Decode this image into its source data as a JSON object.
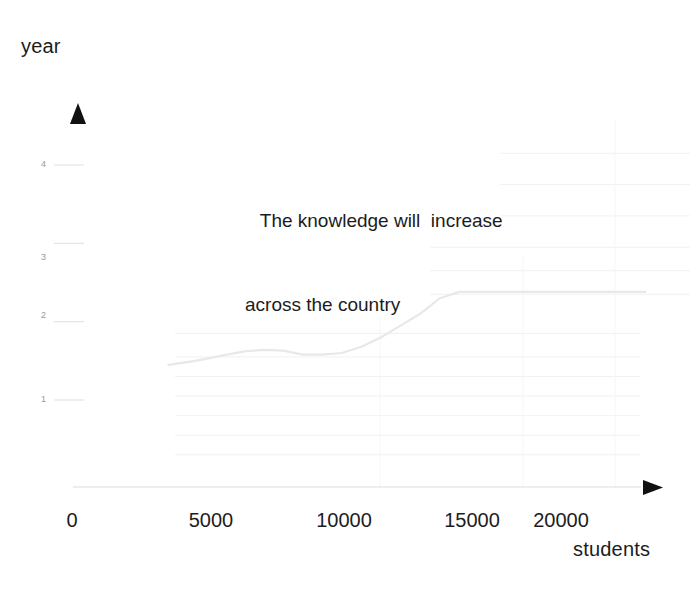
{
  "chart_data": {
    "type": "line",
    "title": "The knowledge will  increase across the country",
    "annotation_lines": [
      "The knowledge will  increase",
      "across the country"
    ],
    "xlabel": "students",
    "ylabel": "year",
    "xlim": [
      0,
      23500
    ],
    "ylim": [
      0,
      4.6
    ],
    "xticks": [
      0,
      5000,
      10000,
      15000,
      20000
    ],
    "xtick_labels": [
      "0",
      "5000",
      "10000",
      "15000",
      "20000"
    ],
    "yticks": [
      1,
      2,
      3,
      4
    ],
    "ytick_labels": [
      "1",
      "2",
      "3",
      "4"
    ],
    "grid": true,
    "grid_orientation": "horizontal",
    "legend": "none",
    "series": [
      {
        "name": "knowledge growth",
        "color": "#e8e8e8",
        "x": [
          3900,
          5000,
          6000,
          7000,
          7800,
          8600,
          9400,
          10200,
          11000,
          11800,
          12600,
          13400,
          14200,
          15000,
          15800,
          17000,
          19000,
          21000,
          23400
        ],
        "y": [
          1.45,
          1.5,
          1.56,
          1.62,
          1.64,
          1.63,
          1.58,
          1.58,
          1.6,
          1.68,
          1.8,
          1.95,
          2.1,
          2.3,
          2.38,
          2.38,
          2.38,
          2.38,
          2.38
        ]
      }
    ],
    "gridline_values": [
      0.3,
      0.55,
      0.8,
      1.05,
      1.3,
      1.55,
      1.85,
      2.35,
      2.65,
      2.95,
      3.35,
      3.75,
      4.15
    ]
  },
  "axes": {
    "y_arrow": "up-arrow-marker",
    "x_arrow": "right-arrow-marker",
    "axis_color": "#d8d8d8",
    "arrow_color": "#111111"
  },
  "colors": {
    "background": "#ffffff",
    "text": "#1c1c1c",
    "tick_label_y": "#9a9a9a",
    "grid": "#f1f1f1",
    "series": "#e8e8e8"
  }
}
